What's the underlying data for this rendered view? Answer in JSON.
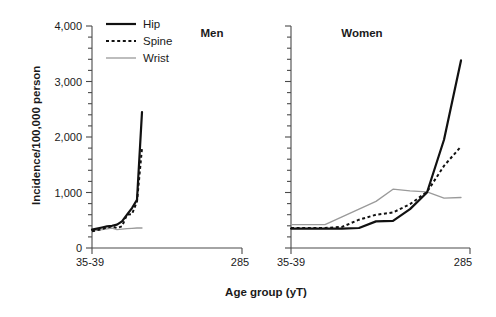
{
  "chart_data": {
    "type": "line",
    "title": "",
    "xlabel": "Age group (yT)",
    "ylabel": "Incidence/100,000 person",
    "ylim": [
      0,
      4000
    ],
    "yticks": [
      0,
      1000,
      2000,
      3000,
      4000
    ],
    "ytick_labels": [
      "0",
      "1,000",
      "2,000",
      "3,000",
      "4,000"
    ],
    "minor_tick_step": 200,
    "grid": false,
    "legend_position": "top-left",
    "legend": [
      "Hip",
      "Spine",
      "Wrist"
    ],
    "categories": [
      "35-39",
      "40-44",
      "45-49",
      "50-54",
      "55-59",
      "60-64",
      "65-69",
      "70-74",
      "75-79",
      "80-84",
      "285"
    ],
    "xtick_labels": [
      "35-39",
      "285"
    ],
    "panels": [
      {
        "name": "Men",
        "title": "Men",
        "series": [
          {
            "name": "Hip",
            "style": "solid-thick-black",
            "color": "#111111",
            "values": [
              330,
              350,
              370,
              390,
              400,
              420,
              480,
              600,
              720,
              870,
              2450
            ]
          },
          {
            "name": "Spine",
            "style": "dotted-black",
            "color": "#111111",
            "values": [
              300,
              320,
              340,
              370,
              390,
              360,
              390,
              600,
              610,
              840,
              1800
            ]
          },
          {
            "name": "Wrist",
            "style": "solid-thin-gray",
            "color": "#9a9a9a",
            "values": [
              310,
              320,
              330,
              345,
              360,
              330,
              340,
              350,
              355,
              360,
              360
            ]
          }
        ]
      },
      {
        "name": "Women",
        "title": "Women",
        "series": [
          {
            "name": "Hip",
            "style": "solid-thick-black",
            "color": "#111111",
            "values": [
              350,
              350,
              350,
              350,
              360,
              480,
              490,
              700,
              1000,
              1950,
              3380
            ]
          },
          {
            "name": "Spine",
            "style": "dotted-black",
            "color": "#111111",
            "values": [
              360,
              360,
              360,
              380,
              510,
              600,
              640,
              790,
              1010,
              1480,
              1830
            ]
          },
          {
            "name": "Wrist",
            "style": "solid-thin-gray",
            "color": "#9a9a9a",
            "values": [
              420,
              420,
              420,
              560,
              700,
              840,
              1060,
              1030,
              1010,
              900,
              910
            ]
          }
        ]
      }
    ]
  },
  "legend": {
    "items": [
      {
        "label": "Hip",
        "swatch": "line-solid-thick"
      },
      {
        "label": "Spine",
        "swatch": "line-dotted"
      },
      {
        "label": "Wrist",
        "swatch": "line-solid-thin"
      }
    ]
  },
  "axes": {
    "y_label": "Incidence/100,000 person",
    "x_label": "Age group (yT)",
    "y_tick_labels": [
      "4,000",
      "3,000",
      "2,000",
      "1,000",
      "0"
    ],
    "x_tick_labels_left": [
      "35-39",
      "285"
    ],
    "x_tick_labels_right": [
      "35-39",
      "285"
    ]
  },
  "panels": {
    "men_title": "Men",
    "women_title": "Women"
  },
  "colors": {
    "hip": "#111111",
    "spine": "#111111",
    "wrist": "#9a9a9a",
    "axis": "#4a4a4a",
    "background": "#ffffff"
  }
}
